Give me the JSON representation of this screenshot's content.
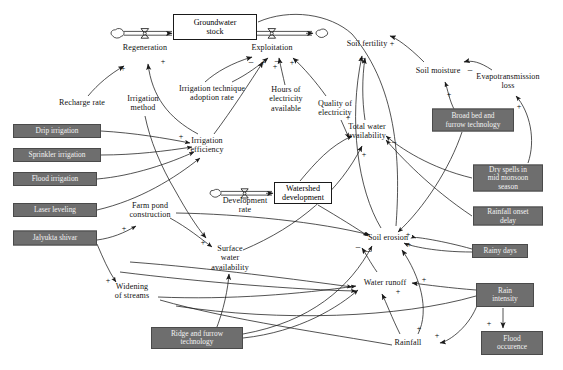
{
  "diagram": {
    "type": "causal-loop-diagram",
    "colors": {
      "intervention_box_fill": "#6e6e6e",
      "intervention_box_text": "#f2f2f2",
      "stock_box_fill": "#ffffff",
      "line": "#1a1a1a",
      "background": "#ffffff"
    },
    "stocks": [
      {
        "id": "groundwater_stock",
        "label": "Groundwater\nstock",
        "x": 215,
        "y": 27,
        "w": 84,
        "h": 26
      },
      {
        "id": "watershed_development",
        "label": "Watershed\ndevelopment",
        "x": 303,
        "y": 193,
        "w": 58,
        "h": 22
      }
    ],
    "flows": [
      {
        "id": "regeneration",
        "label": "Regeneration",
        "x": 145,
        "y": 48
      },
      {
        "id": "exploitation",
        "label": "Exploitation",
        "x": 272,
        "y": 48
      },
      {
        "id": "development_rate",
        "label": "Development\nrate",
        "x": 245,
        "y": 205
      }
    ],
    "variables": [
      {
        "id": "recharge_rate",
        "label": "Recharge rate",
        "x": 82,
        "y": 103
      },
      {
        "id": "irrigation_method",
        "label": "Irrigation\nmethod",
        "x": 143,
        "y": 103
      },
      {
        "id": "irrigation_technique_adoption_rate",
        "label": "Irrigation technique\nadoption rate",
        "x": 212,
        "y": 93
      },
      {
        "id": "hours_of_electricity_available",
        "label": "Hours of\nelectricity\navailable",
        "x": 286,
        "y": 99
      },
      {
        "id": "quality_of_electricity",
        "label": "Quality of\nelectricity",
        "x": 335,
        "y": 108
      },
      {
        "id": "irrigation_efficiency",
        "label": "Irrigation\nefficiency",
        "x": 207,
        "y": 145
      },
      {
        "id": "soil_fertility",
        "label": "Soil fertility",
        "x": 367,
        "y": 44
      },
      {
        "id": "soil_moisture",
        "label": "Soil moisture",
        "x": 438,
        "y": 71
      },
      {
        "id": "evapotransmission_loss",
        "label": "Evapotransmission\nloss",
        "x": 508,
        "y": 81
      },
      {
        "id": "total_water_availability",
        "label": "Total water\navailability",
        "x": 367,
        "y": 131
      },
      {
        "id": "farm_pond_construction",
        "label": "Farm pond\nconstruction",
        "x": 150,
        "y": 210
      },
      {
        "id": "surface_water_availability",
        "label": "Surface\nwater\navailability",
        "x": 230,
        "y": 258
      },
      {
        "id": "widening_of_streams",
        "label": "Widening\nof streams",
        "x": 132,
        "y": 291
      },
      {
        "id": "soil_erosion",
        "label": "Soil erosion",
        "x": 388,
        "y": 238
      },
      {
        "id": "water_runoff",
        "label": "Water runoff",
        "x": 385,
        "y": 283
      },
      {
        "id": "rainfall",
        "label": "Rainfall",
        "x": 408,
        "y": 343
      }
    ],
    "interventions": [
      {
        "id": "drip_irrigation",
        "label": "Drip irrigation",
        "x": 57,
        "y": 131,
        "w": 88,
        "h": 14
      },
      {
        "id": "sprinkler_irrigation",
        "label": "Sprinkler irrigation",
        "x": 57,
        "y": 155,
        "w": 88,
        "h": 14
      },
      {
        "id": "flood_irrigation",
        "label": "Flood irrigation",
        "x": 55,
        "y": 179,
        "w": 84,
        "h": 14
      },
      {
        "id": "laser_leveling",
        "label": "Laser leveling",
        "x": 55,
        "y": 210,
        "w": 84,
        "h": 14
      },
      {
        "id": "jalyukta_shivar",
        "label": "Jalyukta shivar",
        "x": 55,
        "y": 238,
        "w": 84,
        "h": 15
      },
      {
        "id": "ridge_and_furrow_technology",
        "label": "Ridge and furrow\ntechnology",
        "x": 197,
        "y": 338,
        "w": 92,
        "h": 22
      },
      {
        "id": "broad_bed_and_furrow_technology",
        "label": "Broad bed and\nfurrow technology",
        "x": 473,
        "y": 120,
        "w": 82,
        "h": 23
      },
      {
        "id": "dry_spells_in_mid_monsoon_season",
        "label": "Dry spells in\nmid monsoon\nseason",
        "x": 508,
        "y": 178,
        "w": 70,
        "h": 27
      },
      {
        "id": "rainfall_onset_delay",
        "label": "Rainfall onset\ndelay",
        "x": 508,
        "y": 216,
        "w": 70,
        "h": 19
      },
      {
        "id": "rainy_days",
        "label": "Rainy days",
        "x": 500,
        "y": 251,
        "w": 56,
        "h": 14
      },
      {
        "id": "rain_intensity",
        "label": "Rain\nintensity",
        "x": 505,
        "y": 295,
        "w": 58,
        "h": 24
      },
      {
        "id": "flood_occurence",
        "label": "Flood\noccurence",
        "x": 512,
        "y": 343,
        "w": 62,
        "h": 24
      }
    ],
    "polarity_marks": [
      {
        "sign": "+",
        "x": 123,
        "y": 69
      },
      {
        "sign": "+",
        "x": 163,
        "y": 62
      },
      {
        "sign": "−",
        "x": 251,
        "y": 63
      },
      {
        "sign": "+",
        "x": 263,
        "y": 63
      },
      {
        "sign": "+",
        "x": 275,
        "y": 67
      },
      {
        "sign": "−",
        "x": 277,
        "y": 62
      },
      {
        "sign": "+",
        "x": 292,
        "y": 63
      },
      {
        "sign": "+",
        "x": 181,
        "y": 137
      },
      {
        "sign": "+",
        "x": 124,
        "y": 229
      },
      {
        "sign": "+",
        "x": 203,
        "y": 243
      },
      {
        "sign": "+",
        "x": 108,
        "y": 281
      },
      {
        "sign": "+",
        "x": 392,
        "y": 44
      },
      {
        "sign": "−",
        "x": 362,
        "y": 59
      },
      {
        "sign": "−",
        "x": 470,
        "y": 71
      },
      {
        "sign": "+",
        "x": 449,
        "y": 95
      },
      {
        "sign": "+",
        "x": 519,
        "y": 107
      },
      {
        "sign": "+",
        "x": 348,
        "y": 118
      },
      {
        "sign": "−",
        "x": 394,
        "y": 143
      },
      {
        "sign": "+",
        "x": 364,
        "y": 155
      },
      {
        "sign": "+",
        "x": 408,
        "y": 235
      },
      {
        "sign": "+",
        "x": 409,
        "y": 245
      },
      {
        "sign": "−",
        "x": 369,
        "y": 252
      },
      {
        "sign": "−",
        "x": 358,
        "y": 248
      },
      {
        "sign": "+",
        "x": 424,
        "y": 280
      },
      {
        "sign": "+",
        "x": 398,
        "y": 292
      },
      {
        "sign": "+",
        "x": 419,
        "y": 329
      },
      {
        "sign": "+",
        "x": 437,
        "y": 336
      },
      {
        "sign": "+",
        "x": 489,
        "y": 324
      }
    ]
  }
}
